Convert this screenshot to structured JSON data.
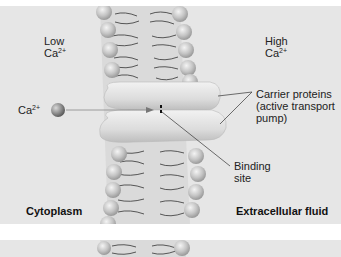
{
  "diagram": {
    "left_side": {
      "concentration_label": "Low",
      "ion": "Ca",
      "ion_charge": "2+",
      "region_label": "Cytoplasm"
    },
    "right_side": {
      "concentration_label": "High",
      "ion": "Ca",
      "ion_charge": "2+",
      "region_label": "Extracellular fluid"
    },
    "ion_label": {
      "ion": "Ca",
      "charge": "2+"
    },
    "callouts": {
      "carrier_line1": "Carrier proteins",
      "carrier_line2": "(active transport",
      "carrier_line3": "pump)",
      "binding_line1": "Binding",
      "binding_line2": "site"
    },
    "colors": {
      "background": "#e6e6e6",
      "phospholipid_head": "#bdbdbd",
      "protein": "#d9d9d9",
      "ion": "#8a8a8a",
      "text": "#222222"
    }
  }
}
